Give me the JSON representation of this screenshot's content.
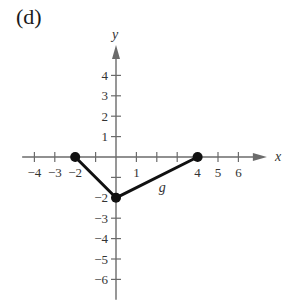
{
  "panel_label": "(d)",
  "chart_data": {
    "type": "line",
    "title": "",
    "xlabel": "x",
    "ylabel": "y",
    "xlim": [
      -4.6,
      7.2
    ],
    "ylim": [
      -7,
      5.2
    ],
    "grid": false,
    "x_ticks": [
      -4,
      -3,
      -2,
      -1,
      1,
      2,
      3,
      4,
      5,
      6
    ],
    "x_tick_labels": [
      "-4",
      "-3",
      "-2",
      "1",
      "4",
      "5",
      "6"
    ],
    "x_tick_label_values": [
      -4,
      -3,
      -2,
      1,
      4,
      5,
      6
    ],
    "y_ticks": [
      -6,
      -5,
      -4,
      -3,
      -2,
      -1,
      1,
      2,
      3,
      4
    ],
    "y_tick_labels": [
      "-6",
      "-5",
      "-4",
      "-3",
      "-2",
      "1",
      "2",
      "3",
      "4"
    ],
    "y_tick_label_values": [
      -6,
      -5,
      -4,
      -3,
      -2,
      1,
      2,
      3,
      4
    ],
    "series": [
      {
        "name": "g",
        "x": [
          -2,
          0,
          4
        ],
        "y": [
          0,
          -2,
          0
        ],
        "endpoints_closed": true
      }
    ],
    "annotations": [
      {
        "text": "g",
        "x": 2,
        "y": -1.5
      }
    ]
  }
}
